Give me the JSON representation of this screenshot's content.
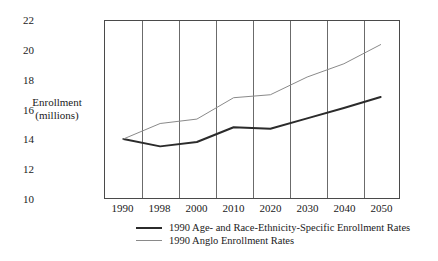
{
  "chart_data": {
    "type": "line",
    "title": "",
    "subtitle": "",
    "xlabel": "",
    "ylabel": "Enrollment\n(millions)",
    "ylabel_line1": "Enrollment",
    "ylabel_line2": "(millions)",
    "categories": [
      "1990",
      "1998",
      "2000",
      "2010",
      "2020",
      "2030",
      "2040",
      "2050"
    ],
    "x_tick_labels": [
      "1990",
      "1998",
      "2000",
      "2010",
      "2020",
      "2030",
      "2040",
      "2050"
    ],
    "y_tick_labels": [
      "22",
      "20",
      "18",
      "16",
      "14",
      "12",
      "10"
    ],
    "y_ticks": [
      22,
      20,
      18,
      16,
      14,
      12,
      10
    ],
    "ylim": [
      10,
      22
    ],
    "grid": "vertical-only",
    "legend_position": "below-axis-left",
    "series": [
      {
        "name": "1990 Age- and Race-Ethnicity-Specific Enrollment Rates",
        "color": "#2b2b2b",
        "width": 2,
        "values": [
          14.0,
          13.5,
          13.8,
          14.8,
          14.7,
          15.4,
          16.1,
          16.85
        ]
      },
      {
        "name": "1990 Anglo Enrollment Rates",
        "color": "#8a8a8a",
        "width": 1,
        "values": [
          14.0,
          15.05,
          15.35,
          16.8,
          17.0,
          18.2,
          19.1,
          20.4
        ]
      }
    ]
  },
  "legend": {
    "entries": [
      {
        "label": "1990 Age- and Race-Ethnicity-Specific Enrollment Rates",
        "style": "dark-thick"
      },
      {
        "label": "1990 Anglo Enrollment Rates",
        "style": "gray-thin"
      }
    ]
  },
  "colors": {
    "background": "#ffffff",
    "frame": "#4a4a4a",
    "gridline": "#6b6b6b",
    "series_dark": "#2b2b2b",
    "series_gray": "#8a8a8a",
    "text": "#1a1a1a"
  }
}
